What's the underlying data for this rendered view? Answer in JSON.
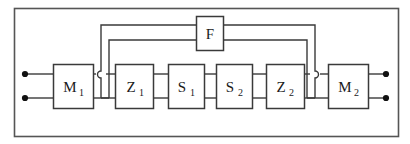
{
  "figure": {
    "name": "block-diagram",
    "colors": {
      "line": "#3a3a3a",
      "block_fill": "#ffffff",
      "frame": "#555555",
      "background": "#ffffff",
      "terminal": "#111111"
    }
  },
  "frame": {
    "x": 14,
    "y": 8,
    "width": 384,
    "height": 128
  },
  "blocks": [
    {
      "id": "M1",
      "label": "M",
      "subscript": "1",
      "x": 53,
      "y": 64,
      "width": 40,
      "height": 44
    },
    {
      "id": "Z1",
      "label": "Z",
      "subscript": "1",
      "x": 115,
      "y": 64,
      "width": 38,
      "height": 44
    },
    {
      "id": "S1",
      "label": "S",
      "subscript": "1",
      "x": 168,
      "y": 64,
      "width": 36,
      "height": 44
    },
    {
      "id": "S2",
      "label": "S",
      "subscript": "2",
      "x": 216,
      "y": 64,
      "width": 36,
      "height": 44
    },
    {
      "id": "Z2",
      "label": "Z",
      "subscript": "2",
      "x": 266,
      "y": 64,
      "width": 38,
      "height": 44
    },
    {
      "id": "M2",
      "label": "M",
      "subscript": "2",
      "x": 328,
      "y": 64,
      "width": 40,
      "height": 44
    }
  ],
  "feedback_block": {
    "id": "F",
    "label": "F",
    "subscript": "",
    "x": 196,
    "y": 16,
    "width": 27,
    "height": 34
  },
  "terminals": [
    {
      "id": "in-top",
      "x": 25,
      "y": 74
    },
    {
      "id": "in-bottom",
      "x": 25,
      "y": 98
    },
    {
      "id": "out-top",
      "x": 386,
      "y": 74
    },
    {
      "id": "out-bottom",
      "x": 386,
      "y": 98
    }
  ],
  "connector_rails": {
    "upper_y": 74,
    "lower_y": 98
  },
  "feedback_paths": {
    "outer_y": 25,
    "inner_y": 40,
    "left_junction_x": 101,
    "right_junction_x": 315,
    "inner_left_x": 109,
    "inner_right_x": 307
  },
  "junction_hops": [
    {
      "id": "left-hop",
      "x": 101,
      "y": 74
    },
    {
      "id": "right-hop",
      "x": 315,
      "y": 74
    }
  ]
}
